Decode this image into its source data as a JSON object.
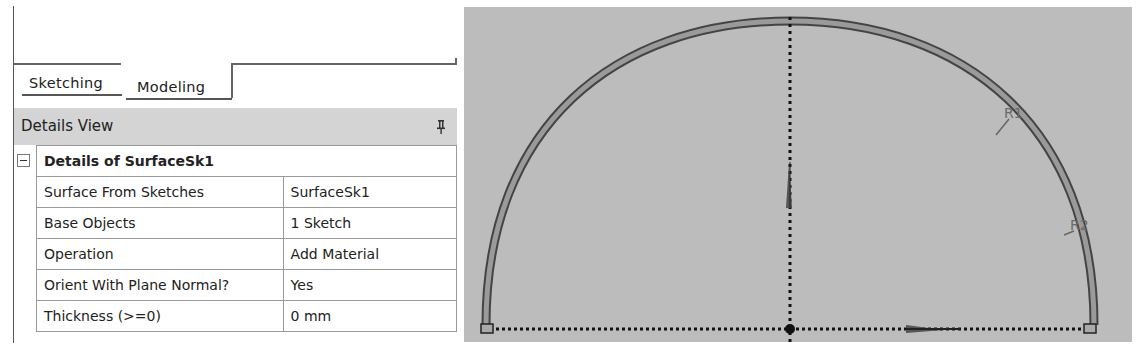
{
  "tabs": [
    {
      "label": "Sketching",
      "active": false
    },
    {
      "label": "Modeling",
      "active": true
    }
  ],
  "details_view": {
    "title": "Details View",
    "pin_icon": "pin-icon",
    "group": {
      "label": "Details of SurfaceSk1",
      "collapse_icon": "minus-box-icon",
      "rows": [
        {
          "name": "Surface From Sketches",
          "value": "SurfaceSk1"
        },
        {
          "name": "Base Objects",
          "value": "1 Sketch"
        },
        {
          "name": "Operation",
          "value": "Add Material"
        },
        {
          "name": "Orient With Plane Normal?",
          "value": "Yes"
        },
        {
          "name": "Thickness (>=0)",
          "value": "0 mm"
        }
      ]
    }
  },
  "viewport": {
    "background": "#bcbcbc",
    "dimension_labels": [
      "R1",
      "R2"
    ],
    "geometry": "semicircular arch surface sketch with dotted horizontal and vertical axes"
  }
}
